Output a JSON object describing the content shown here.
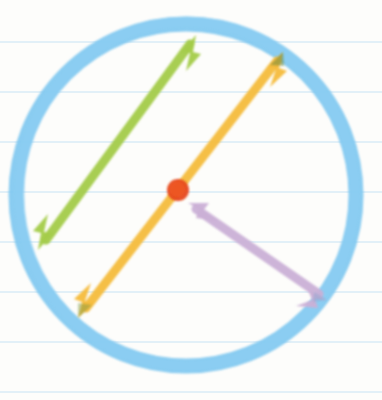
{
  "page": {
    "width": 382,
    "height": 400,
    "background_color": "#fdfdfb"
  },
  "paper": {
    "type": "ruled-notebook-paper",
    "rule_color": "#bfdff2",
    "rule_thickness": 1,
    "rule_spacing": 50,
    "rule_y_positions": [
      42,
      92,
      142,
      192,
      242,
      292,
      342,
      392
    ]
  },
  "chart_data": {
    "type": "diagram",
    "shapes": [
      {
        "name": "circle",
        "label": "circle outline",
        "color": "#7fc8f0",
        "stroke_width": 15,
        "center": [
          186,
          195
        ],
        "radius": 169,
        "bounds": {
          "left": 10,
          "top": 18,
          "right": 362,
          "bottom": 372
        }
      },
      {
        "name": "center-dot",
        "label": "centre point",
        "color": "#e6471b",
        "center": [
          178,
          190
        ],
        "radius": 11
      }
    ],
    "arrows": [
      {
        "name": "green-chord-arrow",
        "label": "chord",
        "color": "#a4cc4a",
        "stroke_width": 9,
        "start": [
          38,
          250
        ],
        "end": [
          196,
          35
        ],
        "heads": "both",
        "passes_through_center": false
      },
      {
        "name": "yellow-diameter-arrow",
        "label": "diameter",
        "color": "#f5bc3c",
        "stroke_width": 9,
        "start": [
          78,
          318
        ],
        "end": [
          283,
          52
        ],
        "heads": "both",
        "passes_through_center": true
      },
      {
        "name": "purple-radius-arrow",
        "label": "radius",
        "color": "#cbb0d6",
        "stroke_width": 9,
        "start": [
          188,
          203
        ],
        "end": [
          327,
          300
        ],
        "heads": "both",
        "passes_through_center": false
      }
    ],
    "colors": {
      "circle": "#7fc8f0",
      "chord": "#a4cc4a",
      "diameter": "#f5bc3c",
      "radius": "#cbb0d6",
      "center": "#e6471b",
      "ruled_line": "#bfdff2",
      "paper": "#fdfdfb"
    }
  }
}
